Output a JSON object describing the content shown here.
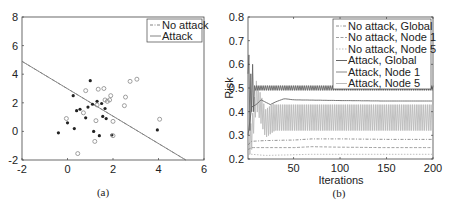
{
  "chart_data": [
    {
      "type": "scatter",
      "panel": "(a)",
      "title": "",
      "xlabel": "",
      "ylabel": "",
      "xlim": [
        -2,
        6
      ],
      "ylim": [
        -2,
        8
      ],
      "xticks": [
        -2,
        0,
        2,
        4,
        6
      ],
      "yticks": [
        -2,
        0,
        2,
        4,
        6,
        8
      ],
      "grid": false,
      "legend_position": "upper right",
      "legend": [
        "No attack",
        "Attack"
      ],
      "series": [
        {
          "name": "No attack",
          "kind": "line",
          "style": "dash-dot",
          "x": [
            -2,
            5.2
          ],
          "y": [
            4.9,
            -2.0
          ]
        },
        {
          "name": "Attack",
          "kind": "line",
          "style": "solid",
          "x": [
            -2,
            5.2
          ],
          "y": [
            4.9,
            -2.0
          ]
        },
        {
          "name": "Class 1 (filled)",
          "kind": "points",
          "marker": "filled-dot",
          "points": [
            [
              -0.4,
              -0.1
            ],
            [
              0.0,
              0.6
            ],
            [
              0.25,
              2.5
            ],
            [
              0.3,
              0.2
            ],
            [
              0.4,
              1.45
            ],
            [
              0.55,
              1.55
            ],
            [
              0.8,
              0.95
            ],
            [
              0.9,
              1.7
            ],
            [
              1.0,
              3.55
            ],
            [
              1.1,
              1.9
            ],
            [
              1.15,
              0.0
            ],
            [
              1.3,
              2.1
            ],
            [
              1.4,
              -0.3
            ],
            [
              1.5,
              1.95
            ],
            [
              1.55,
              1.05
            ],
            [
              1.65,
              1.6
            ],
            [
              1.7,
              0.9
            ],
            [
              1.95,
              -0.25
            ],
            [
              3.95,
              0.1
            ]
          ]
        },
        {
          "name": "Class 2 (open)",
          "kind": "points",
          "marker": "open-circle",
          "points": [
            [
              -0.05,
              0.9
            ],
            [
              0.45,
              -1.55
            ],
            [
              0.7,
              1.3
            ],
            [
              0.8,
              2.85
            ],
            [
              1.2,
              -0.7
            ],
            [
              1.25,
              0.75
            ],
            [
              1.3,
              1.85
            ],
            [
              1.35,
              2.95
            ],
            [
              1.6,
              3.0
            ],
            [
              1.65,
              2.2
            ],
            [
              1.75,
              2.1
            ],
            [
              1.85,
              2.2
            ],
            [
              1.9,
              2.5
            ],
            [
              2.0,
              -0.3
            ],
            [
              2.0,
              0.7
            ],
            [
              2.5,
              1.8
            ],
            [
              2.55,
              2.4
            ],
            [
              2.75,
              3.5
            ],
            [
              3.05,
              3.65
            ],
            [
              4.05,
              0.85
            ]
          ]
        }
      ]
    },
    {
      "type": "line",
      "panel": "(b)",
      "title": "",
      "xlabel": "Iterations",
      "ylabel": "Risk",
      "xlim": [
        1,
        200
      ],
      "ylim": [
        0.2,
        0.8
      ],
      "xticks": [
        50,
        100,
        150,
        200
      ],
      "yticks": [
        0.2,
        0.3,
        0.4,
        0.5,
        0.6,
        0.7,
        0.8
      ],
      "grid": false,
      "legend_position": "upper right",
      "legend": [
        "No attack, Global",
        "No attack, Node 1",
        "No attack, Node 5",
        "Attack, Global",
        "Attack, Node 1",
        "Attack, Node 5"
      ],
      "series": [
        {
          "name": "No attack, Global",
          "style": "dash-dot",
          "x": [
            1,
            5,
            20,
            50,
            70,
            100,
            150,
            200
          ],
          "y": [
            0.26,
            0.275,
            0.278,
            0.28,
            0.285,
            0.285,
            0.283,
            0.283
          ]
        },
        {
          "name": "No attack, Node 1",
          "style": "dashed",
          "x": [
            1,
            5,
            20,
            50,
            70,
            100,
            150,
            200
          ],
          "y": [
            0.24,
            0.248,
            0.248,
            0.248,
            0.252,
            0.25,
            0.248,
            0.248
          ]
        },
        {
          "name": "No attack, Node 5",
          "style": "dotted",
          "x": [
            1,
            5,
            20,
            50,
            70,
            100,
            150,
            200
          ],
          "y": [
            0.22,
            0.22,
            0.215,
            0.218,
            0.22,
            0.22,
            0.22,
            0.22
          ]
        },
        {
          "name": "Attack, Global",
          "style": "solid",
          "oscillating": true,
          "x": [
            1,
            3,
            5,
            10,
            20,
            50,
            100,
            150,
            200
          ],
          "y": [
            0.66,
            0.42,
            0.5,
            0.5,
            0.5,
            0.5,
            0.5,
            0.5,
            0.5
          ],
          "band": [
            0.49,
            0.51
          ]
        },
        {
          "name": "Attack, Node 1",
          "style": "solid",
          "x": [
            1,
            5,
            10,
            15,
            20,
            25,
            30,
            40,
            50,
            100,
            150,
            200
          ],
          "y": [
            0.3,
            0.42,
            0.43,
            0.45,
            0.44,
            0.43,
            0.44,
            0.455,
            0.45,
            0.447,
            0.445,
            0.445
          ]
        },
        {
          "name": "Attack, Node 5",
          "style": "solid-light",
          "oscillating": true,
          "x": [
            1,
            5,
            10,
            20,
            30,
            40,
            50,
            100,
            150,
            200
          ],
          "y": [
            0.26,
            0.3,
            0.47,
            0.35,
            0.38,
            0.38,
            0.375,
            0.375,
            0.375,
            0.375
          ],
          "band": [
            0.32,
            0.43
          ]
        }
      ]
    }
  ],
  "panel_a": {
    "caption": "(a)",
    "xticks": [
      "-2",
      "0",
      "2",
      "4",
      "6"
    ],
    "yticks": [
      "-2",
      "0",
      "2",
      "4",
      "6",
      "8"
    ],
    "legend": [
      "No attack",
      "Attack"
    ]
  },
  "panel_b": {
    "caption": "(b)",
    "xlabel": "Iterations",
    "ylabel": "Risk",
    "xticks": [
      "50",
      "100",
      "150",
      "200"
    ],
    "yticks": [
      "0.2",
      "0.3",
      "0.4",
      "0.5",
      "0.6",
      "0.7",
      "0.8"
    ],
    "legend": [
      "No attack, Global",
      "No attack, Node 1",
      "No attack, Node 5",
      "Attack, Global",
      "Attack, Node 1",
      "Attack, Node 5"
    ]
  },
  "colors": {
    "axis": "#333333",
    "line_dark": "#555555",
    "line_mid": "#888888",
    "line_light": "#bbbbbb"
  }
}
